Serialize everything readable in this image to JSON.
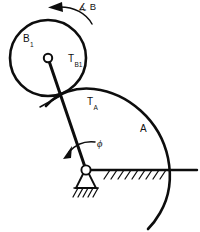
{
  "figure": {
    "name": "kinematic-linkage-diagram",
    "background_color": "#ffffff",
    "line_color": "#0d0d0d",
    "width": 200,
    "height": 232
  },
  "labels": {
    "body_b1": "B",
    "body_b1_sub": "1",
    "torque_b1": "T",
    "torque_b1_sub": "B1",
    "torque_a": "T",
    "torque_a_sub": "A",
    "body_a": "A",
    "angle_phi": "ϕ",
    "omega_b": "∡ B"
  },
  "geometry": {
    "circle_b1": {
      "cx": 48,
      "cy": 58,
      "r": 38
    },
    "hub_b1": {
      "cx": 48,
      "cy": 58,
      "r": 4.2
    },
    "arc_a": {
      "cx": 86,
      "cy": 170,
      "r": 83
    },
    "pivot": {
      "cx": 86,
      "cy": 170,
      "r": 4.6
    },
    "link": {
      "x1": 48,
      "y1": 58,
      "x2": 86,
      "y2": 170
    },
    "ground_line": {
      "x1": 86,
      "y1": 170,
      "x2": 196,
      "y2": 170
    },
    "contact_tick": {
      "x1": 42,
      "y1": 104,
      "x2": 62,
      "y2": 94
    }
  },
  "annotations": {
    "rotation_arrow_b": "counterclockwise-curved-arrow",
    "rotation_arrow_phi": "counterclockwise-curved-arrow",
    "support_type": "pin-support-with-ground-hatching",
    "ground_hatching": "diagonal-hatch-marks"
  }
}
